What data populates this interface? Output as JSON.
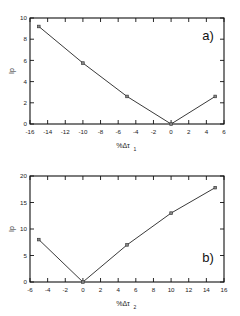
{
  "figure": {
    "background_color": "#ffffff",
    "line_color": "#3a3a3a",
    "marker_color": "#8c8c8c",
    "axis_color": "#111111"
  },
  "panels": [
    {
      "key": "a",
      "label": "a)",
      "ylabel": "Ip",
      "xlabel_main": "%Δτ",
      "xlabel_sub": "1",
      "xticks": [
        -16,
        -14,
        -12,
        -10,
        -8,
        -6,
        -4,
        -2,
        0,
        2,
        4,
        6
      ],
      "xticklabels": [
        "-16",
        "-14",
        "-12",
        "-10",
        "-8",
        "-6",
        "-4",
        "-2",
        "0",
        "2",
        "4",
        "6"
      ],
      "yticks": [
        0,
        2,
        4,
        6,
        8,
        10
      ],
      "yticklabels": [
        "0",
        "2",
        "4",
        "6",
        "8",
        "10"
      ]
    },
    {
      "key": "b",
      "label": "b)",
      "ylabel": "Ip",
      "xlabel_main": "%Δτ",
      "xlabel_sub": "2",
      "xticks": [
        -6,
        -4,
        -2,
        0,
        2,
        4,
        6,
        8,
        10,
        12,
        14,
        16
      ],
      "xticklabels": [
        "-6",
        "-4",
        "-2",
        "0",
        "2",
        "4",
        "6",
        "8",
        "10",
        "12",
        "14",
        "16"
      ],
      "yticks": [
        0,
        5,
        10,
        15,
        20
      ],
      "yticklabels": [
        "0",
        "5",
        "10",
        "15",
        "20"
      ]
    }
  ],
  "chart_data": [
    {
      "type": "line",
      "panel": "a",
      "title": "a)",
      "xlabel": "%Δτ₁",
      "ylabel": "Ip",
      "xlim": [
        -16,
        6
      ],
      "ylim": [
        0,
        10
      ],
      "grid": false,
      "legend": null,
      "markers": "square",
      "x": [
        -15,
        -10,
        -5,
        0,
        5
      ],
      "values": [
        9.2,
        5.75,
        2.6,
        0.0,
        2.6
      ]
    },
    {
      "type": "line",
      "panel": "b",
      "title": "b)",
      "xlabel": "%Δτ₂",
      "ylabel": "Ip",
      "xlim": [
        -6,
        16
      ],
      "ylim": [
        0,
        20
      ],
      "grid": false,
      "legend": null,
      "markers": "square",
      "x": [
        -5,
        0,
        5,
        10,
        15
      ],
      "values": [
        8.0,
        0.0,
        7.0,
        13.0,
        17.8
      ]
    }
  ]
}
